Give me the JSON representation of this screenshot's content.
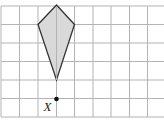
{
  "figure": {
    "grid": {
      "color": "#b3b3b3",
      "vertical_lines_x": [
        1,
        19.5,
        38,
        56.5,
        74.5,
        93,
        111,
        129.5,
        147.5
      ],
      "horizontal_lines_y": [
        6,
        24.5,
        43,
        61.5,
        80,
        98.5,
        117
      ],
      "x_extent": [
        1,
        164
      ],
      "y_extent": [
        6,
        117
      ]
    },
    "kite": {
      "fill": "#d9d9d9",
      "stroke": "#333333",
      "vertices": [
        [
          56.5,
          5
        ],
        [
          74.5,
          24.5
        ],
        [
          56.5,
          80
        ],
        [
          38,
          24.5
        ]
      ]
    },
    "point": {
      "label": "X",
      "x": 56.5,
      "y": 99,
      "color": "#111111"
    }
  }
}
